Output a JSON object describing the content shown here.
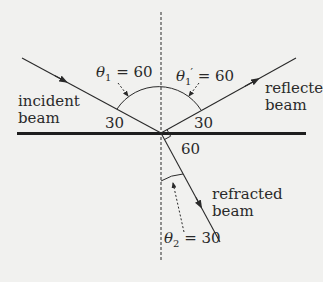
{
  "diagram": {
    "type": "reflection-refraction",
    "colors": {
      "background": "#f1f1ef",
      "stroke": "#2a2a2a",
      "surface": "#1e1e1e"
    },
    "labels": {
      "incident_beam": "incident beam",
      "reflected_beam": "reflected beam",
      "refracted_beam": "refracted beam",
      "theta_symbol": "θ",
      "theta1_sub": "1",
      "theta1_value": " = 60",
      "theta1prime_sub": "1",
      "theta1prime_prime": "′",
      "theta1prime_value": " = 60",
      "theta2_sub": "2",
      "theta2_value": " = 30",
      "angle_incident_surface": "30",
      "angle_reflected_surface": "30",
      "angle_refracted_surface": "60"
    },
    "angles": {
      "theta1": 60,
      "theta1_prime": 60,
      "theta2": 30,
      "incident_to_surface": 30,
      "reflected_to_surface": 30,
      "refracted_to_surface": 60
    }
  }
}
